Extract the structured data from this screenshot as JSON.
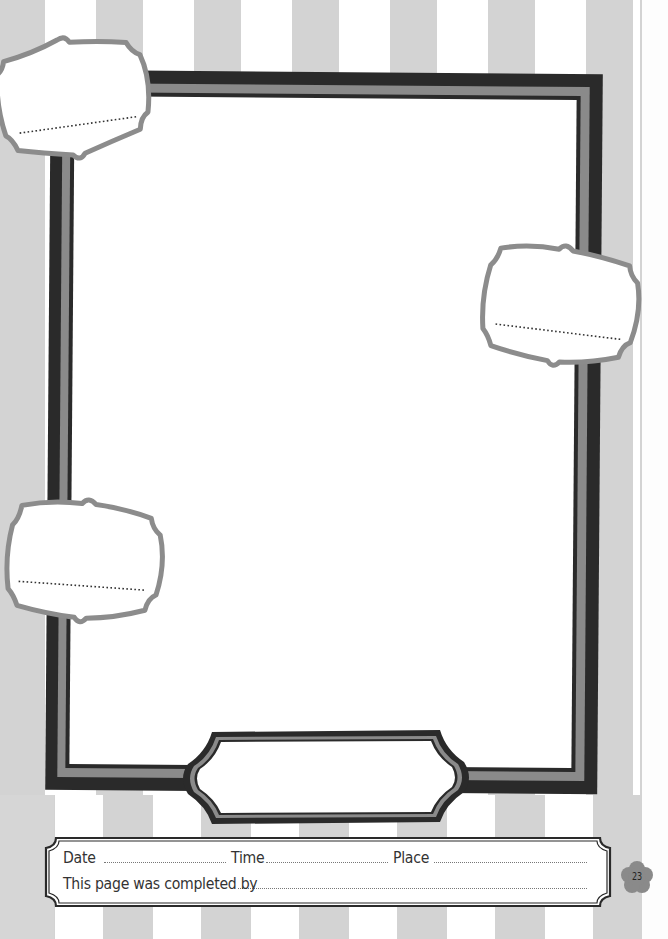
{
  "page": {
    "type": "scrapbook-photo-page",
    "background": "vertical-gray-stripes",
    "colors": {
      "stripe": "#d3d3d3",
      "frame_dark": "#2a2a2a",
      "frame_gray": "#8a8a8a",
      "tag_outline": "#8c8c8c",
      "badge": "#8a8a8a"
    }
  },
  "photo_frame": {
    "content": ""
  },
  "caption_tags": [
    {
      "position": "top-left",
      "text": ""
    },
    {
      "position": "right",
      "text": ""
    },
    {
      "position": "left",
      "text": ""
    }
  ],
  "title_plaque": {
    "text": ""
  },
  "footer": {
    "date_label": "Date",
    "date_value": "",
    "time_label": "Time",
    "time_value": "",
    "place_label": "Place",
    "place_value": "",
    "completed_by_label": "This page was completed by",
    "completed_by_value": ""
  },
  "page_number": "23"
}
